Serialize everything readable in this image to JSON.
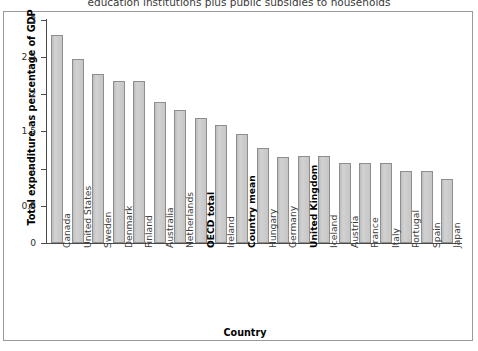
{
  "figure": {
    "title": "education institutions plus public subsidies to households",
    "frame_border_color": "#9a9a9a",
    "bar_fill_color": "#c9c9c9",
    "bar_border_color": "#8e8e8e",
    "axis_color": "#4a4a4a"
  },
  "chart_data": {
    "type": "bar",
    "title": "education institutions plus public subsidies to households",
    "xlabel": "Country",
    "ylabel": "Total expenditure as percentage of GDP",
    "ylim": [
      0,
      3
    ],
    "yticks": [
      "0",
      "0.5",
      "1",
      "1.5",
      "2",
      "2.5",
      "3"
    ],
    "ytick_values": [
      0,
      0.5,
      1,
      1.5,
      2,
      2.5,
      3
    ],
    "grid": false,
    "legend": null,
    "categories": [
      "Canada",
      "United States",
      "Sweden",
      "Denmark",
      "Finland",
      "Australia",
      "Netherlands",
      "OECD total",
      "Ireland",
      "Country mean",
      "Hungary",
      "Germany",
      "United Kingdom",
      "Iceland",
      "Austria",
      "France",
      "Italy",
      "Portugal",
      "Spain",
      "Japan"
    ],
    "values": [
      2.79,
      2.47,
      2.27,
      2.17,
      2.17,
      1.89,
      1.78,
      1.68,
      1.58,
      1.46,
      1.27,
      1.16,
      1.17,
      1.17,
      1.07,
      1.07,
      1.08,
      0.97,
      0.96,
      0.86
    ],
    "emphasized_categories": [
      "OECD total",
      "Country mean",
      "United Kingdom"
    ]
  }
}
